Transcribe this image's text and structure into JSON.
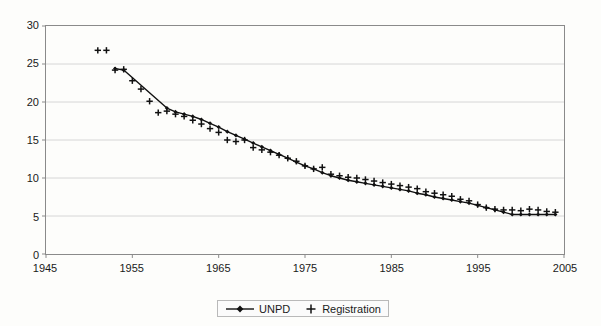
{
  "chart_data": {
    "type": "line",
    "title": "",
    "subtitle": "",
    "xlabel": "",
    "ylabel": "",
    "xlim": [
      1945,
      2005
    ],
    "ylim": [
      0,
      30
    ],
    "xticks": [
      1945,
      1955,
      1965,
      1975,
      1985,
      1995,
      2005
    ],
    "yticks": [
      0,
      5,
      10,
      15,
      20,
      25,
      30
    ],
    "grid": "horizontal",
    "legend_position": "bottom-center",
    "colors": {
      "line": "#111111",
      "marker": "#111111",
      "grid": "#d6d6d6",
      "axis": "#8a8a8a",
      "background": "#fdfdfb"
    },
    "series": [
      {
        "name": "UNPD",
        "marker": "diamond",
        "style": "line-with-markers",
        "x": [
          1953,
          1954,
          1959,
          1960,
          1961,
          1962,
          1963,
          1964,
          1965,
          1966,
          1967,
          1968,
          1969,
          1970,
          1971,
          1972,
          1973,
          1974,
          1975,
          1976,
          1977,
          1978,
          1979,
          1980,
          1981,
          1982,
          1983,
          1984,
          1985,
          1986,
          1987,
          1988,
          1989,
          1990,
          1991,
          1992,
          1993,
          1994,
          1995,
          1996,
          1997,
          1998,
          1999,
          2000,
          2001,
          2002,
          2003,
          2004
        ],
        "y": [
          24.4,
          24.2,
          19.2,
          18.7,
          18.4,
          18.1,
          17.7,
          17.2,
          16.7,
          16.1,
          15.6,
          15.1,
          14.6,
          14.1,
          13.6,
          13.1,
          12.6,
          12.1,
          11.6,
          11.2,
          10.7,
          10.3,
          10.0,
          9.7,
          9.5,
          9.3,
          9.1,
          8.9,
          8.7,
          8.5,
          8.3,
          8.0,
          7.8,
          7.5,
          7.3,
          7.1,
          6.9,
          6.7,
          6.4,
          6.1,
          5.8,
          5.5,
          5.2,
          5.2,
          5.2,
          5.2,
          5.2,
          5.2
        ]
      },
      {
        "name": "Registration",
        "marker": "plus",
        "style": "markers-only",
        "x": [
          1951,
          1952,
          1953,
          1954,
          1955,
          1956,
          1957,
          1958,
          1959,
          1960,
          1961,
          1962,
          1963,
          1964,
          1965,
          1966,
          1967,
          1968,
          1969,
          1970,
          1971,
          1972,
          1973,
          1974,
          1975,
          1976,
          1977,
          1978,
          1979,
          1980,
          1981,
          1982,
          1983,
          1984,
          1985,
          1986,
          1987,
          1988,
          1989,
          1990,
          1991,
          1992,
          1993,
          1994,
          1995,
          1996,
          1997,
          1998,
          1999,
          2000,
          2001,
          2002,
          2003,
          2004
        ],
        "y": [
          26.8,
          26.8,
          24.2,
          24.3,
          22.8,
          21.7,
          20.1,
          18.6,
          18.8,
          18.4,
          18.1,
          17.6,
          17.1,
          16.5,
          16.0,
          15.0,
          14.8,
          15.0,
          14.0,
          13.7,
          13.4,
          13.0,
          12.6,
          12.2,
          11.6,
          11.2,
          11.4,
          10.5,
          10.3,
          10.1,
          10.0,
          9.8,
          9.6,
          9.4,
          9.2,
          9.0,
          8.8,
          8.6,
          8.2,
          8.0,
          7.8,
          7.6,
          7.2,
          7.0,
          6.5,
          6.1,
          5.9,
          5.8,
          5.8,
          5.7,
          5.9,
          5.8,
          5.6,
          5.5
        ]
      }
    ]
  },
  "legend": {
    "entries": [
      {
        "label": "UNPD",
        "marker": "line-diamond"
      },
      {
        "label": "Registration",
        "marker": "plus"
      }
    ]
  },
  "axes": {
    "y_tick_labels": [
      "0",
      "5",
      "10",
      "15",
      "20",
      "25",
      "30"
    ],
    "x_tick_labels": [
      "1945",
      "1955",
      "1965",
      "1975",
      "1985",
      "1995",
      "2005"
    ]
  }
}
